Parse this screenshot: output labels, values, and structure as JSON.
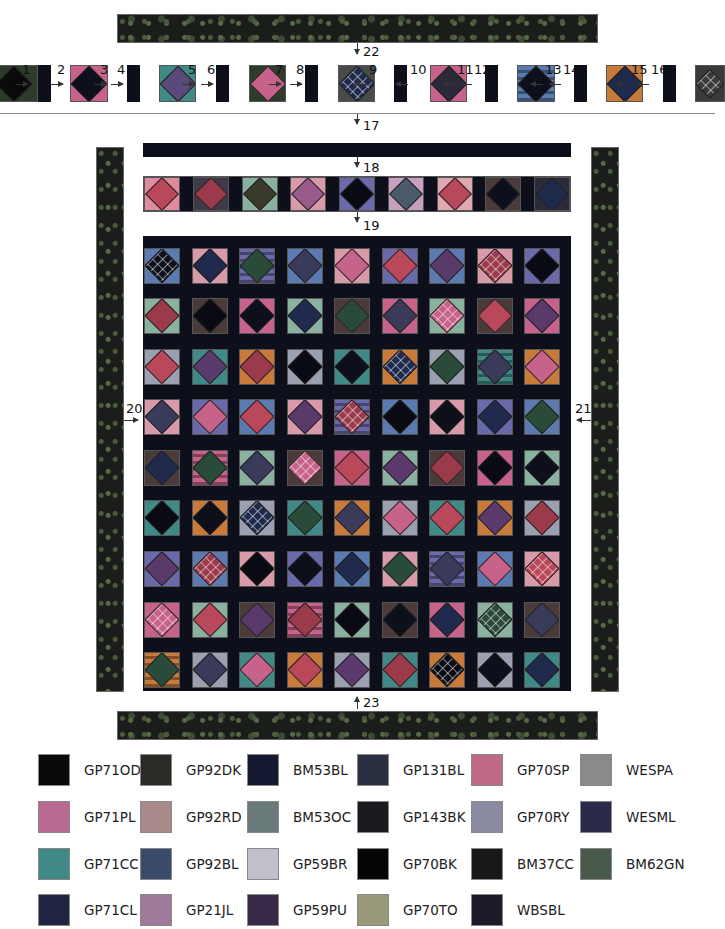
{
  "diagram": {
    "step_labels": {
      "top_border": "22",
      "row_assembly": "17",
      "top_sashing": "18",
      "pieced_row": "19",
      "left_border": "20",
      "right_border": "21",
      "bottom_border": "23"
    },
    "row_piece_labels": [
      "1",
      "2",
      "3",
      "4",
      "5",
      "6",
      "7",
      "8",
      "9",
      "10",
      "11",
      "12",
      "13",
      "14",
      "15",
      "16"
    ],
    "colors": {
      "sashing": "#0d0f1a",
      "border_fabric": "#1a1d1a",
      "pink": "#c7628a",
      "teal": "#3f8a86",
      "navy": "#1f2a4d",
      "orange": "#c77a3a",
      "blue": "#4a6fb0",
      "green": "#5a8a4a",
      "purple": "#6a4a8a",
      "rust": "#9a4a2a"
    }
  },
  "top_strip_blocks": [
    {
      "corner": "#2d3b2a",
      "diamond": "#0a0a0a"
    },
    {
      "corner": "#c7628a",
      "diamond": "#0d0f1a"
    },
    {
      "corner": "#3f8a86",
      "diamond": "#5a4a7a"
    },
    {
      "corner": "#2d3b2a",
      "diamond": "#c7628a"
    },
    {
      "corner": "#4a4a4a",
      "diamond": "#1f2a4d",
      "pattern": "grid"
    },
    {
      "corner": "#c7628a",
      "diamond": "#2a2a3a"
    },
    {
      "corner": "#5a7ab0",
      "diamond": "#0d0f1a",
      "striped": true
    },
    {
      "corner": "#c77a3a",
      "diamond": "#1f2a4d"
    },
    {
      "corner": "#3a3a3a",
      "diamond": "#3a3a3a",
      "pattern": "grid"
    }
  ],
  "pieced_row_blocks": [
    {
      "corner": "#e08aa0",
      "diamond": "#b8485a"
    },
    {
      "corner": "#3f3a4a",
      "diamond": "#9a3a4a"
    },
    {
      "corner": "#8ab0a0",
      "diamond": "#3a3a2a"
    },
    {
      "corner": "#d89aa8",
      "diamond": "#9a5a8a"
    },
    {
      "corner": "#6a6aaa",
      "diamond": "#0a0a14"
    },
    {
      "corner": "#c7a0c0",
      "diamond": "#4a5a6a"
    },
    {
      "corner": "#e0a8b0",
      "diamond": "#b8485a"
    },
    {
      "corner": "#4a3a3a",
      "diamond": "#0d0f1a"
    },
    {
      "corner": "#2a2a3a",
      "diamond": "#1f2a4d"
    }
  ],
  "quilt_grid": {
    "rows": 9,
    "cols": 9,
    "corner_palette": [
      "#5a7ab0",
      "#c7628a",
      "#3f8a86",
      "#d89aa8",
      "#8ab0a0",
      "#c77a3a",
      "#6a6aaa",
      "#4a3a3a",
      "#9aa0b0"
    ],
    "diamond_palette": [
      "#0d0f1a",
      "#b8485a",
      "#1f2a4d",
      "#5a3a6a",
      "#2a4a3a",
      "#9a3a4a",
      "#3a3a5a",
      "#0a0a14",
      "#c7628a"
    ]
  },
  "legend": [
    {
      "code": "GP71OD",
      "color": "#0a0a0a"
    },
    {
      "code": "GP71PL",
      "color": "#b86a90"
    },
    {
      "code": "GP71CC",
      "color": "#3f8a86"
    },
    {
      "code": "GP71CL",
      "color": "#1f2440"
    },
    {
      "code": "GP92DK",
      "color": "#2a2a26"
    },
    {
      "code": "GP92RD",
      "color": "#a88a8a"
    },
    {
      "code": "GP92BL",
      "color": "#3a4a6a"
    },
    {
      "code": "GP21JL",
      "color": "#a07a9a"
    },
    {
      "code": "BM53BL",
      "color": "#141830"
    },
    {
      "code": "BM53OC",
      "color": "#6a7a7a"
    },
    {
      "code": "GP59BR",
      "color": "#c0c0c8"
    },
    {
      "code": "GP59PU",
      "color": "#3a2a4a"
    },
    {
      "code": "GP131BL",
      "color": "#2a3040"
    },
    {
      "code": "GP143BK",
      "color": "#1a1a1e"
    },
    {
      "code": "GP70BK",
      "color": "#050505"
    },
    {
      "code": "GP70TO",
      "color": "#9a9a7a"
    },
    {
      "code": "GP70SP",
      "color": "#c06a8a"
    },
    {
      "code": "GP70RY",
      "color": "#8a8aa0"
    },
    {
      "code": "BM37CC",
      "color": "#181818"
    },
    {
      "code": "WBSBL",
      "color": "#1a1a28"
    },
    {
      "code": "WESPA",
      "color": "#8a8a8a"
    },
    {
      "code": "WESML",
      "color": "#2a2a4a"
    },
    {
      "code": "BM62GN",
      "color": "#4a5a4a"
    }
  ]
}
